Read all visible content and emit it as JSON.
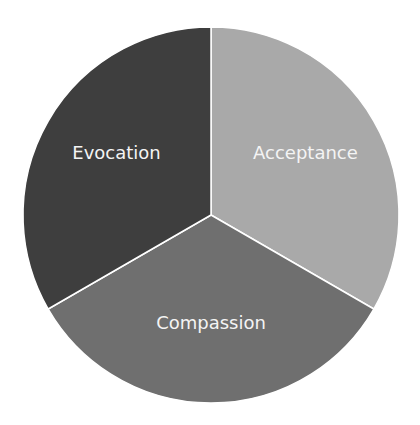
{
  "chart_data": {
    "type": "pie",
    "title": "",
    "categories": [
      "Acceptance",
      "Compassion",
      "Evocation"
    ],
    "values": [
      33.33,
      33.33,
      33.33
    ],
    "colors": [
      "#a9a9a9",
      "#6f6f6f",
      "#3e3e3e"
    ],
    "label_color": "#f4f4f4",
    "start_angle_deg": 0,
    "direction": "clockwise",
    "legend": "none",
    "data_labels": "category name inside slice",
    "geometry": {
      "cx": 211,
      "cy": 215,
      "r": 188
    }
  }
}
